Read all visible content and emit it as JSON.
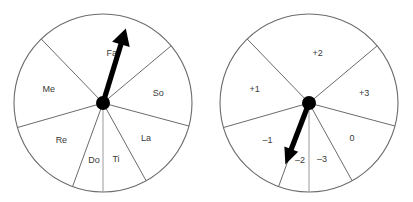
{
  "figure": {
    "background_color": "#ffffff",
    "width": 413,
    "height": 202,
    "stroke_color": "#6b6b6b",
    "label_color": "#3a3a3a",
    "needle_color": "#000000"
  },
  "wheels": [
    {
      "id": "solfege-wheel",
      "name": "left-wheel",
      "center_x": 103,
      "center_y": 103,
      "radius": 89,
      "hub_radius": 7,
      "needle_angle_deg": 73,
      "needle_length": 78,
      "sectors": [
        {
          "label": "Fa",
          "start_deg": 40,
          "end_deg": 134,
          "label_radius": 50,
          "label_angle_deg": 80
        },
        {
          "label": "Me",
          "start_deg": 134,
          "end_deg": 196,
          "label_radius": 56,
          "label_angle_deg": 166
        },
        {
          "label": "Re",
          "start_deg": 196,
          "end_deg": 250,
          "label_radius": 56,
          "label_angle_deg": 222
        },
        {
          "label": "Do",
          "start_deg": 250,
          "end_deg": 270,
          "label_radius": 58,
          "label_angle_deg": 261
        },
        {
          "label": "Ti",
          "start_deg": 270,
          "end_deg": 299,
          "label_radius": 58,
          "label_angle_deg": 283
        },
        {
          "label": "La",
          "start_deg": 299,
          "end_deg": 345,
          "label_radius": 56,
          "label_angle_deg": 320
        },
        {
          "label": "So",
          "start_deg": 345,
          "end_deg": 40,
          "label_radius": 56,
          "label_angle_deg": 10
        }
      ]
    },
    {
      "id": "scale-degree-wheel",
      "name": "right-wheel",
      "center_x": 103,
      "center_y": 103,
      "radius": 89,
      "hub_radius": 7,
      "needle_angle_deg": 249,
      "needle_length": 66,
      "sectors": [
        {
          "label": "+2",
          "start_deg": 40,
          "end_deg": 134,
          "label_radius": 50,
          "label_angle_deg": 80
        },
        {
          "label": "+1",
          "start_deg": 134,
          "end_deg": 196,
          "label_radius": 56,
          "label_angle_deg": 166
        },
        {
          "label": "–1",
          "start_deg": 196,
          "end_deg": 250,
          "label_radius": 56,
          "label_angle_deg": 222
        },
        {
          "label": "–2",
          "start_deg": 250,
          "end_deg": 270,
          "label_radius": 58,
          "label_angle_deg": 261
        },
        {
          "label": "–3",
          "start_deg": 270,
          "end_deg": 299,
          "label_radius": 58,
          "label_angle_deg": 283
        },
        {
          "label": "0",
          "start_deg": 299,
          "end_deg": 345,
          "label_radius": 56,
          "label_angle_deg": 320
        },
        {
          "label": "+3",
          "start_deg": 345,
          "end_deg": 40,
          "label_radius": 56,
          "label_angle_deg": 10
        }
      ]
    }
  ]
}
